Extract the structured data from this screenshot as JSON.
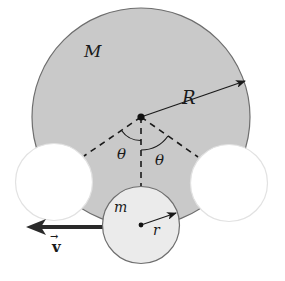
{
  "figure": {
    "colors": {
      "big_disk_fill": "#c9c9c9",
      "big_disk_stroke": "#6e6e6e",
      "small_disk_fill": "#ebebeb",
      "ghost_disk_fill": "#ffffff",
      "ghost_disk_stroke": "#e2e2e2",
      "ink": "#1a1a1a",
      "velocity_arrow": "#2a2a2a"
    },
    "labels": {
      "big_mass": "M",
      "big_radius": "R",
      "angle_left": "θ",
      "angle_right": "θ",
      "small_mass": "m",
      "small_radius": "r",
      "velocity": "v",
      "velocity_vector_mark": "→"
    }
  }
}
